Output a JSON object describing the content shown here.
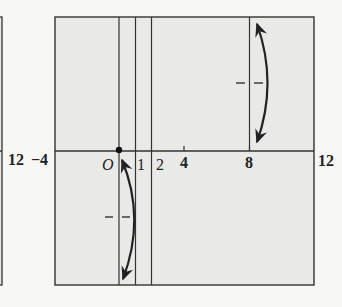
{
  "figure": {
    "colors": {
      "background": "#f7f7f5",
      "panel_fill": "#e9e9e7",
      "line": "#333333"
    },
    "left_panel": {
      "axis_label_right": "12"
    },
    "main_panel": {
      "x_range": [
        -4,
        12
      ],
      "axis_labels": {
        "left_end": "−4",
        "origin": "O",
        "ticks": [
          {
            "value": 1,
            "label": "1"
          },
          {
            "value": 2,
            "label": "2"
          },
          {
            "value": 4,
            "label": "4"
          },
          {
            "value": 8,
            "label": "8"
          }
        ],
        "right_end": "12"
      },
      "vertical_lines_at_x": [
        0,
        1,
        2,
        8
      ],
      "origin_point": {
        "x": 0,
        "y": 0
      },
      "curves": [
        {
          "name": "upper-right-curve",
          "near_x": 8,
          "region": "above axis",
          "arrows": "both ends"
        },
        {
          "name": "lower-left-curve",
          "near_x": 0,
          "region": "below axis",
          "arrows": "both ends"
        }
      ]
    }
  }
}
